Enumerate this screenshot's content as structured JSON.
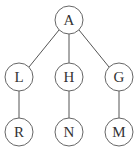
{
  "diagram": {
    "type": "tree",
    "nodes": [
      {
        "id": "A",
        "label": "A",
        "x": 69,
        "y": 20
      },
      {
        "id": "L",
        "label": "L",
        "x": 19,
        "y": 77
      },
      {
        "id": "H",
        "label": "H",
        "x": 69,
        "y": 77
      },
      {
        "id": "G",
        "label": "G",
        "x": 119,
        "y": 77
      },
      {
        "id": "R",
        "label": "R",
        "x": 19,
        "y": 132
      },
      {
        "id": "N",
        "label": "N",
        "x": 69,
        "y": 132
      },
      {
        "id": "M",
        "label": "M",
        "x": 119,
        "y": 132
      }
    ],
    "edges": [
      [
        "A",
        "L"
      ],
      [
        "A",
        "H"
      ],
      [
        "A",
        "G"
      ],
      [
        "L",
        "R"
      ],
      [
        "H",
        "N"
      ],
      [
        "G",
        "M"
      ]
    ],
    "node_radius": 14
  }
}
